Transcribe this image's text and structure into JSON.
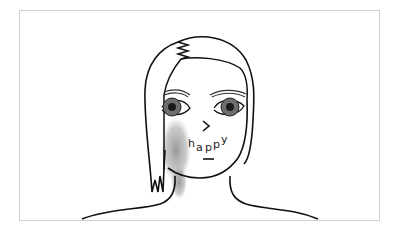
{
  "illustration": {
    "subject": "line drawing of a person's head and shoulders",
    "text_on_face": [
      "h",
      "a",
      "p",
      "p",
      "y"
    ],
    "nose_glyph": ">",
    "colors": {
      "line": "#111111",
      "shadow": "#9a9a9a",
      "iris": "#6e6e6e",
      "pupil": "#1a1a1a",
      "frame_border": "#cfcfcf"
    }
  }
}
